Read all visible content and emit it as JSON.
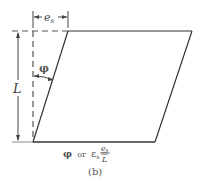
{
  "figure": {
    "part_label": "(b)",
    "labels": {
      "top_dimension": "e",
      "top_dimension_sub": "s",
      "height_dimension": "L",
      "angle": "φ"
    },
    "caption": {
      "phi": "φ",
      "or": "or",
      "epsilon": "ε",
      "epsilon_sub": "s",
      "equals": "=",
      "numerator": "e",
      "numerator_sub": "s",
      "denominator": "L"
    },
    "colors": {
      "line": "#333333",
      "dashed": "#555555",
      "text": "#444444"
    }
  }
}
